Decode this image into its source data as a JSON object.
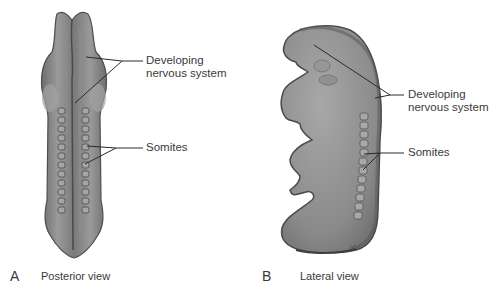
{
  "figure": {
    "panels": [
      {
        "letter": "A",
        "caption": "Posterior view",
        "labels": {
          "nervous_line1": "Developing",
          "nervous_line2": "nervous system",
          "somites": "Somites"
        }
      },
      {
        "letter": "B",
        "caption": "Lateral view",
        "labels": {
          "nervous_line1": "Developing",
          "nervous_line2": "nervous system",
          "somites": "Somites"
        }
      }
    ],
    "colors": {
      "embryo_fill": "#8c8c8c",
      "embryo_light": "#b0b0b0",
      "embryo_dark": "#5a5a5a",
      "text": "#3a3a3a",
      "leader": "#2a2a2a"
    }
  }
}
